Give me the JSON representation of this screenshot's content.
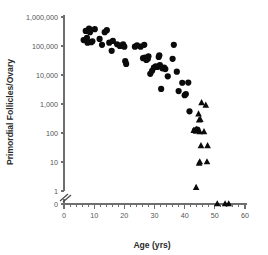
{
  "chart_data": {
    "type": "scatter",
    "title": "",
    "xlabel": "Age (yrs)",
    "ylabel": "Primordial Follicles/Ovary",
    "xlim": [
      0,
      60
    ],
    "ylim": [
      0,
      1000000
    ],
    "yscale": "log",
    "y_axis_break": true,
    "y_break_between": [
      1,
      0
    ],
    "grid": false,
    "legend": "none",
    "x_ticks": [
      0,
      10,
      20,
      30,
      40,
      50,
      60
    ],
    "x_tick_labels": [
      "0",
      "10",
      "20",
      "30",
      "40",
      "50",
      "60"
    ],
    "x_minor_tick_step": 2,
    "y_ticks": [
      1000000,
      100000,
      10000,
      1000,
      100,
      10,
      1,
      0
    ],
    "y_tick_labels": [
      "1,000,000",
      "100,000",
      "10,000",
      "1,000",
      "100",
      "10",
      "1",
      "0"
    ],
    "marker_color": "#0b0b0b",
    "axis_color": "#6f6f6f",
    "series": [
      {
        "name": "Circles",
        "marker": "circle",
        "points": [
          [
            6.5,
            160000
          ],
          [
            7.2,
            330000
          ],
          [
            7.6,
            190000
          ],
          [
            7.8,
            130000
          ],
          [
            8.3,
            400000
          ],
          [
            8.6,
            300000
          ],
          [
            9.0,
            135000
          ],
          [
            9.4,
            145000
          ],
          [
            10.2,
            380000
          ],
          [
            11.8,
            175000
          ],
          [
            12.6,
            110000
          ],
          [
            13.5,
            300000
          ],
          [
            14.2,
            350000
          ],
          [
            15.0,
            130000
          ],
          [
            15.8,
            68000
          ],
          [
            16.2,
            150000
          ],
          [
            17.6,
            115000
          ],
          [
            18.5,
            100000
          ],
          [
            19.2,
            105000
          ],
          [
            19.6,
            115000
          ],
          [
            20.0,
            95000
          ],
          [
            20.3,
            30000
          ],
          [
            20.6,
            24000
          ],
          [
            23.5,
            95000
          ],
          [
            24.2,
            105000
          ],
          [
            25.4,
            95000
          ],
          [
            26.6,
            110000
          ],
          [
            26.2,
            38000
          ],
          [
            26.8,
            40000
          ],
          [
            27.3,
            33000
          ],
          [
            27.8,
            36000
          ],
          [
            28.0,
            44000
          ],
          [
            28.6,
            11000
          ],
          [
            29.2,
            14000
          ],
          [
            29.8,
            18000
          ],
          [
            30.4,
            20000
          ],
          [
            30.9,
            19000
          ],
          [
            31.4,
            42000
          ],
          [
            31.6,
            48000
          ],
          [
            31.8,
            22000
          ],
          [
            32.2,
            3300
          ],
          [
            32.6,
            17000
          ],
          [
            33.2,
            18000
          ],
          [
            33.6,
            16000
          ],
          [
            34.4,
            9000
          ],
          [
            36.0,
            36000
          ],
          [
            36.4,
            110000
          ],
          [
            37.4,
            13000
          ],
          [
            38.0,
            2800
          ],
          [
            39.2,
            5400
          ],
          [
            40.0,
            2000
          ],
          [
            40.4,
            2200
          ],
          [
            41.2,
            5500
          ],
          [
            41.6,
            560
          ],
          [
            43.4,
            120
          ],
          [
            44.2,
            130
          ]
        ]
      },
      {
        "name": "Triangles",
        "marker": "triangle",
        "points": [
          [
            45.6,
            1100
          ],
          [
            47.0,
            900
          ],
          [
            44.6,
            450
          ],
          [
            44.8,
            280
          ],
          [
            45.2,
            290
          ],
          [
            43.0,
            120
          ],
          [
            43.6,
            125
          ],
          [
            44.0,
            130
          ],
          [
            45.0,
            110
          ],
          [
            46.4,
            110
          ],
          [
            45.4,
            36
          ],
          [
            47.6,
            36
          ],
          [
            44.8,
            9
          ],
          [
            45.0,
            10
          ],
          [
            47.4,
            10
          ],
          [
            43.8,
            1.3
          ],
          [
            50.8,
            0
          ],
          [
            53.4,
            0
          ],
          [
            54.6,
            0
          ]
        ]
      }
    ]
  }
}
